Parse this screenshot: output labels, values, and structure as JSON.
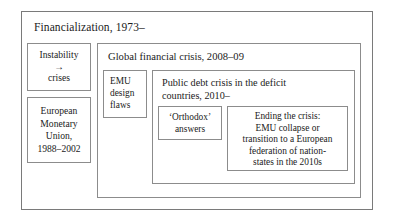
{
  "diagram": {
    "type": "nested-box-diagram",
    "outer": {
      "title": "Financialization, 1973–"
    },
    "left_column": {
      "instability": {
        "line1": "Instability",
        "arrow": "→",
        "line2": "crises"
      },
      "emu_union": {
        "line1": "European",
        "line2": "Monetary",
        "line3": "Union,",
        "line4": "1988–2002"
      }
    },
    "global_financial_crisis": {
      "title": "Global financial crisis, 2008–09",
      "emu_design_flaws": {
        "line1": "EMU",
        "line2": "design",
        "line3": "flaws"
      },
      "public_debt_crisis": {
        "title": "Public debt crisis in the deficit countries, 2010–",
        "orthodox_answers": {
          "line1": "‘Orthodox’",
          "line2": "answers"
        },
        "ending_the_crisis": {
          "line1": "Ending the crisis:",
          "line2": "EMU collapse or",
          "line3": "transition to a European",
          "line4": "federation of nation-",
          "line5": "states in the 2010s"
        }
      }
    }
  }
}
